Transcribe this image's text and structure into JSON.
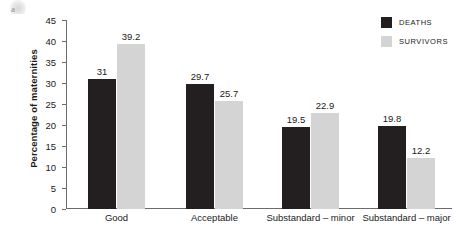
{
  "chart_data": {
    "type": "bar",
    "title": "",
    "xlabel": "",
    "ylabel": "Percentage of maternities",
    "categories": [
      "Good",
      "Acceptable",
      "Substandard – minor",
      "Substandard – major"
    ],
    "series": [
      {
        "name": "DEATHS",
        "color": "#231f20",
        "values": [
          31,
          29.7,
          19.5,
          19.8
        ],
        "labels": [
          "31",
          "29.7",
          "19.5",
          "19.8"
        ]
      },
      {
        "name": "SURVIVORS",
        "color": "#d4d4d4",
        "values": [
          39.2,
          25.7,
          22.9,
          12.2
        ],
        "labels": [
          "39.2",
          "25.7",
          "22.9",
          "12.2"
        ]
      }
    ],
    "ylim": [
      0,
      45
    ],
    "yticks": [
      0,
      5,
      10,
      15,
      20,
      25,
      30,
      35,
      40,
      45
    ],
    "ytick_labels": [
      "0",
      "5",
      "10",
      "15",
      "20",
      "25",
      "30",
      "35",
      "40",
      "45"
    ],
    "grid": false,
    "legend_position": "top-right",
    "legend": [
      "DEATHS",
      "SURVIVORS"
    ]
  },
  "artifact": {
    "glyph": "a"
  }
}
